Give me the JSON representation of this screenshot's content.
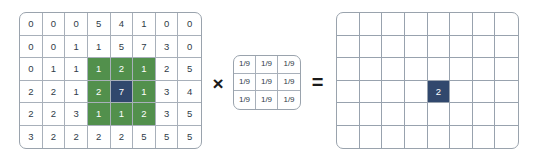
{
  "figure": {
    "type": "convolution-diagram"
  },
  "input_matrix": {
    "name": "input-image-matrix",
    "rows": 6,
    "cols": 8,
    "values": [
      [
        "0",
        "0",
        "0",
        "5",
        "4",
        "1",
        "0",
        "0"
      ],
      [
        "0",
        "0",
        "1",
        "1",
        "5",
        "7",
        "3",
        "0"
      ],
      [
        "0",
        "1",
        "1",
        "1",
        "2",
        "1",
        "2",
        "5"
      ],
      [
        "2",
        "2",
        "1",
        "2",
        "7",
        "1",
        "3",
        "4"
      ],
      [
        "2",
        "2",
        "3",
        "1",
        "1",
        "2",
        "3",
        "5"
      ],
      [
        "3",
        "2",
        "2",
        "2",
        "2",
        "5",
        "5",
        "5"
      ]
    ],
    "highlight_green": [
      [
        2,
        3
      ],
      [
        2,
        4
      ],
      [
        2,
        5
      ],
      [
        3,
        3
      ],
      [
        3,
        5
      ],
      [
        4,
        3
      ],
      [
        4,
        4
      ],
      [
        4,
        5
      ]
    ],
    "highlight_blue": [
      [
        3,
        4
      ]
    ]
  },
  "multiply_operator": {
    "name": "multiply-operator",
    "symbol": "×"
  },
  "kernel_matrix": {
    "name": "kernel-matrix",
    "rows": 3,
    "cols": 3,
    "values": [
      [
        "1/9",
        "1/9",
        "1/9"
      ],
      [
        "1/9",
        "1/9",
        "1/9"
      ],
      [
        "1/9",
        "1/9",
        "1/9"
      ]
    ]
  },
  "equals_operator": {
    "name": "equals-operator",
    "symbol": "="
  },
  "output_matrix": {
    "name": "output-image-matrix",
    "rows": 6,
    "cols": 8,
    "values": [
      [
        "",
        "",
        "",
        "",
        "",
        "",
        "",
        ""
      ],
      [
        "",
        "",
        "",
        "",
        "",
        "",
        "",
        ""
      ],
      [
        "",
        "",
        "",
        "",
        "",
        "",
        "",
        ""
      ],
      [
        "",
        "",
        "",
        "",
        "2",
        "",
        "",
        ""
      ],
      [
        "",
        "",
        "",
        "",
        "",
        "",
        "",
        ""
      ],
      [
        "",
        "",
        "",
        "",
        "",
        "",
        "",
        ""
      ]
    ],
    "highlight_blue": [
      [
        3,
        4
      ]
    ]
  },
  "colors": {
    "green_highlight": "#52904c",
    "blue_highlight": "#31486d",
    "grid_line": "#a8b0ba",
    "matrix_border": "#9aa3ad",
    "text": "#2f3b47",
    "highlight_text": "#ffffff",
    "background": "#ffffff"
  }
}
